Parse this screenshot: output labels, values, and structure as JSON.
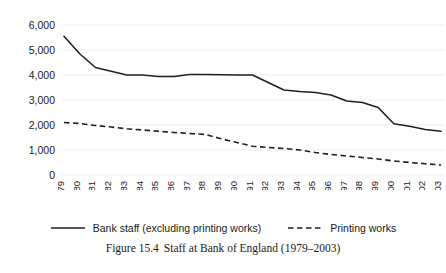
{
  "chart_data": {
    "type": "line",
    "title": "",
    "xlabel": "",
    "ylabel": "",
    "ylim": [
      0,
      6000
    ],
    "yticks": [
      0,
      1000,
      2000,
      3000,
      4000,
      5000,
      6000
    ],
    "ytick_labels": [
      "0",
      "1,000",
      "2,000",
      "3,000",
      "4,000",
      "5,000",
      "6,000"
    ],
    "grid": true,
    "legend_position": "bottom",
    "x": [
      1979,
      1980,
      1981,
      1982,
      1983,
      1984,
      1985,
      1986,
      1987,
      1988,
      1989,
      1990,
      1991,
      1992,
      1993,
      1994,
      1995,
      1996,
      1997,
      1998,
      1999,
      2000,
      2001,
      2002,
      2003
    ],
    "xtick_labels": [
      "1979",
      "1980",
      "1981",
      "1982",
      "1983",
      "1984",
      "1985",
      "1986",
      "1987",
      "1988",
      "1989",
      "1990",
      "1991",
      "1992",
      "1993",
      "1994",
      "1995",
      "1996",
      "1997",
      "1998",
      "1999",
      "2000",
      "2001",
      "2002",
      "2003"
    ],
    "series": [
      {
        "name": "Bank staff (excluding printing works)",
        "style": "solid",
        "color": "#231f20",
        "values": [
          5550,
          4850,
          4300,
          4150,
          4000,
          4000,
          3940,
          3940,
          4020,
          4020,
          4010,
          4000,
          4000,
          3700,
          3400,
          3340,
          3300,
          3200,
          2960,
          2900,
          2700,
          2050,
          1950,
          1820,
          1750
        ]
      },
      {
        "name": "Printing works",
        "style": "dashed",
        "color": "#231f20",
        "values": [
          2100,
          2060,
          1980,
          1920,
          1850,
          1800,
          1750,
          1700,
          1660,
          1620,
          1450,
          1300,
          1150,
          1100,
          1060,
          1000,
          900,
          820,
          760,
          700,
          640,
          560,
          500,
          450,
          400
        ]
      }
    ]
  },
  "legend": {
    "entries": [
      {
        "label": "Bank staff (excluding printing works)",
        "style": "solid"
      },
      {
        "label": "Printing works",
        "style": "dashed"
      }
    ]
  },
  "caption": {
    "number": "Figure 15.4",
    "text": "Staff at Bank of England (1979–2003)"
  }
}
